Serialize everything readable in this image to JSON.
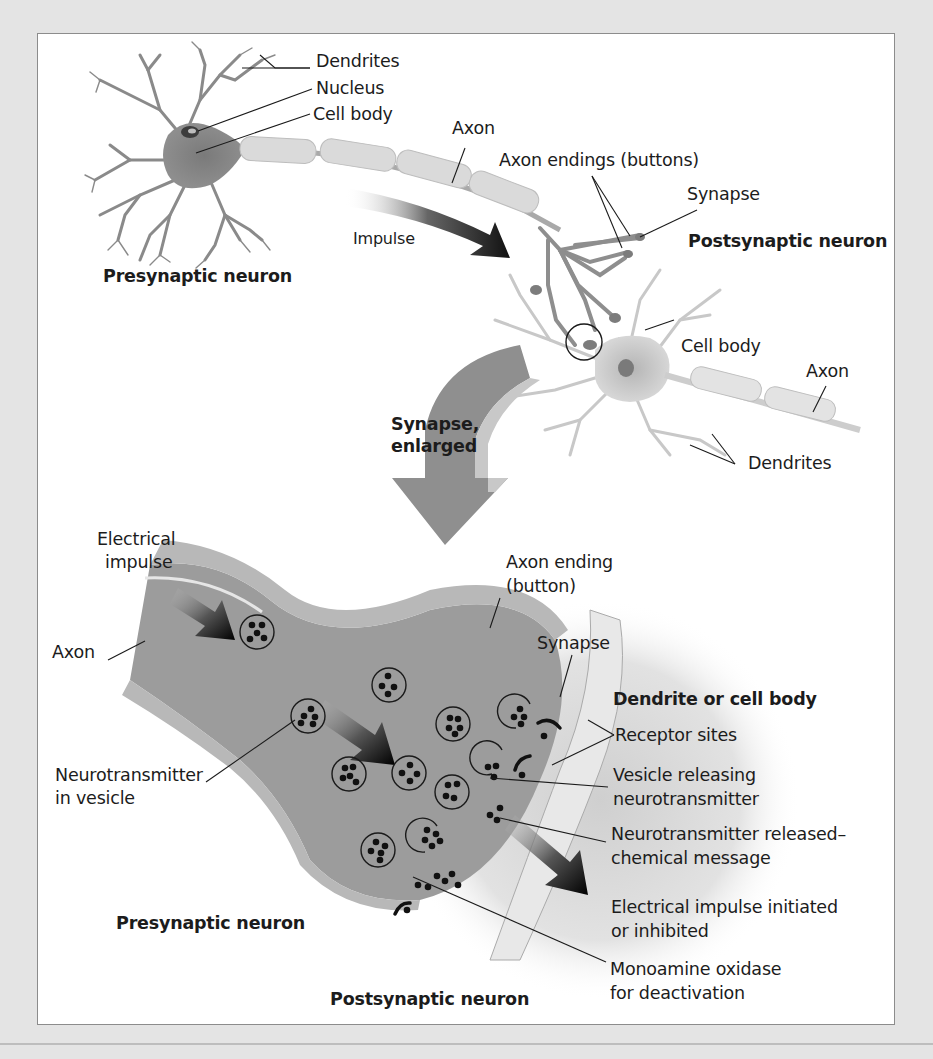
{
  "figure": {
    "top_section": {
      "presynaptic": {
        "dendrites": "Dendrites",
        "nucleus": "Nucleus",
        "cell_body": "Cell body",
        "axon": "Axon",
        "impulse": "Impulse",
        "caption": "Presynaptic neuron"
      },
      "axon_endings": "Axon endings (buttons)",
      "synapse": "Synapse",
      "postsynaptic": {
        "caption": "Postsynaptic neuron",
        "cell_body": "Cell body",
        "axon": "Axon",
        "dendrites": "Dendrites"
      },
      "enlarge_arrow": {
        "line1": "Synapse,",
        "line2": "enlarged"
      }
    },
    "bottom_section": {
      "electrical_impulse": {
        "line1": "Electrical",
        "line2": "impulse"
      },
      "axon": "Axon",
      "axon_ending": {
        "line1": "Axon ending",
        "line2": "(button)"
      },
      "synapse": "Synapse",
      "dendrite_or_cell_body": "Dendrite or cell body",
      "receptor_sites": "Receptor sites",
      "neurotransmitter_in_vesicle": {
        "line1": "Neurotransmitter",
        "line2": "in vesicle"
      },
      "vesicle_releasing": {
        "line1": "Vesicle releasing",
        "line2": "neurotransmitter"
      },
      "neurotransmitter_released": {
        "line1": "Neurotransmitter released–",
        "line2": "chemical message"
      },
      "impulse_initiated": {
        "line1": "Electrical impulse initiated",
        "line2": "or inhibited"
      },
      "monoamine_oxidase": {
        "line1": "Monoamine oxidase",
        "line2": "for deactivation"
      },
      "presynaptic_caption": "Presynaptic neuron",
      "postsynaptic_caption": "Postsynaptic neuron"
    },
    "colors": {
      "page_background": "#e4e4e4",
      "panel_background": "#ffffff",
      "panel_border": "#8c8c8c",
      "neuron_fill": "#8a8a8a",
      "myelin_fill": "#d8d8d8",
      "terminal_fill": "#9a9a9a",
      "vesicle_dot": "#111111"
    }
  }
}
